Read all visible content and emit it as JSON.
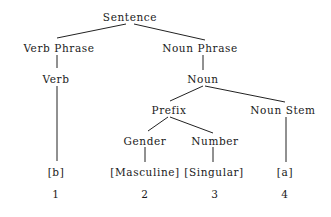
{
  "diagram": {
    "type": "tree",
    "nodes": [
      {
        "id": "sentence",
        "label": "Sentence",
        "x": 130,
        "y": 11
      },
      {
        "id": "verb_phrase",
        "label": "Verb Phrase",
        "x": 59,
        "y": 42
      },
      {
        "id": "noun_phrase",
        "label": "Noun Phrase",
        "x": 200,
        "y": 42
      },
      {
        "id": "verb",
        "label": "Verb",
        "x": 56,
        "y": 73
      },
      {
        "id": "noun",
        "label": "Noun",
        "x": 203,
        "y": 73
      },
      {
        "id": "prefix",
        "label": "Prefix",
        "x": 169,
        "y": 104
      },
      {
        "id": "noun_stem",
        "label": "Noun Stem",
        "x": 283,
        "y": 104
      },
      {
        "id": "gender",
        "label": "Gender",
        "x": 145,
        "y": 135
      },
      {
        "id": "number",
        "label": "Number",
        "x": 215,
        "y": 135
      },
      {
        "id": "b",
        "label": "[b]",
        "x": 56,
        "y": 166
      },
      {
        "id": "masculine",
        "label": "[Masculine]",
        "x": 145,
        "y": 166
      },
      {
        "id": "singular",
        "label": "[Singular]",
        "x": 214,
        "y": 166
      },
      {
        "id": "a",
        "label": "[a]",
        "x": 285,
        "y": 166
      }
    ],
    "indices": [
      {
        "label": "1",
        "x": 56,
        "y": 188
      },
      {
        "label": "2",
        "x": 145,
        "y": 188
      },
      {
        "label": "3",
        "x": 215,
        "y": 188
      },
      {
        "label": "4",
        "x": 285,
        "y": 188
      }
    ],
    "edges": [
      {
        "from": "sentence",
        "to": "verb_phrase",
        "x1": 126,
        "y1": 24,
        "x2": 57,
        "y2": 38
      },
      {
        "from": "sentence",
        "to": "noun_phrase",
        "x1": 134,
        "y1": 24,
        "x2": 205,
        "y2": 40
      },
      {
        "from": "verb_phrase",
        "to": "verb",
        "x1": 57,
        "y1": 55,
        "x2": 57,
        "y2": 68
      },
      {
        "from": "noun_phrase",
        "to": "noun",
        "x1": 203,
        "y1": 55,
        "x2": 203,
        "y2": 70
      },
      {
        "from": "verb",
        "to": "b",
        "x1": 57,
        "y1": 86,
        "x2": 57,
        "y2": 161
      },
      {
        "from": "noun",
        "to": "prefix",
        "x1": 203,
        "y1": 86,
        "x2": 170,
        "y2": 101
      },
      {
        "from": "noun",
        "to": "noun_stem",
        "x1": 205,
        "y1": 86,
        "x2": 285,
        "y2": 102
      },
      {
        "from": "prefix",
        "to": "gender",
        "x1": 168,
        "y1": 117,
        "x2": 148,
        "y2": 131
      },
      {
        "from": "prefix",
        "to": "number",
        "x1": 170,
        "y1": 117,
        "x2": 213,
        "y2": 133
      },
      {
        "from": "gender",
        "to": "masculine",
        "x1": 145,
        "y1": 147,
        "x2": 145,
        "y2": 162
      },
      {
        "from": "number",
        "to": "singular",
        "x1": 213,
        "y1": 147,
        "x2": 213,
        "y2": 162
      },
      {
        "from": "noun_stem",
        "to": "a",
        "x1": 286,
        "y1": 117,
        "x2": 286,
        "y2": 162
      }
    ],
    "line_color": "#222222",
    "text_color": "#1a1a1a"
  }
}
